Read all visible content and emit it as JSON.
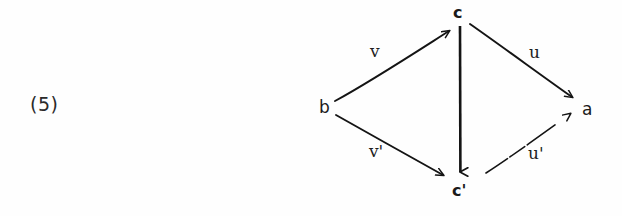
{
  "document": {
    "equation_number": "(5)",
    "kind": "hand-drawn commutative diagram (scanned)"
  },
  "diagram": {
    "nodes": [
      {
        "id": "c_top",
        "label": "c",
        "x": 460,
        "y": 14
      },
      {
        "id": "b",
        "label": "b",
        "x": 326,
        "y": 108
      },
      {
        "id": "a",
        "label": "a",
        "x": 589,
        "y": 110
      },
      {
        "id": "c_bottom",
        "label": "c'",
        "x": 461,
        "y": 192
      }
    ],
    "edges": [
      {
        "id": "b_to_c",
        "from": "b",
        "to": "c_top",
        "label": "v",
        "label_x": 376,
        "label_y": 51
      },
      {
        "id": "c_to_a",
        "from": "c_top",
        "to": "a",
        "label": "u",
        "label_x": 535,
        "label_y": 52
      },
      {
        "id": "b_to_cprime",
        "from": "b",
        "to": "c_bottom",
        "label": "v'",
        "label_x": 377,
        "label_y": 152
      },
      {
        "id": "cprime_to_a",
        "from": "c_bottom",
        "to": "a",
        "label": "u'",
        "label_x": 538,
        "label_y": 154
      },
      {
        "id": "c_to_cprime",
        "from": "c_top",
        "to": "c_bottom",
        "label": "",
        "label_x": 0,
        "label_y": 0
      }
    ],
    "ink_color": "#141414",
    "background_color": "#fefefe"
  }
}
